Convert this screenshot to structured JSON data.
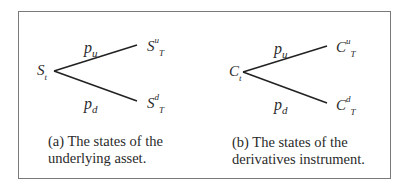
{
  "panels": [
    {
      "id": "a",
      "root": {
        "base": "S",
        "sub": "t"
      },
      "up_prob": {
        "base": "p",
        "sub": "u"
      },
      "down_prob": {
        "base": "p",
        "sub": "d"
      },
      "up_node": {
        "base": "S",
        "sup": "u",
        "sub": "T"
      },
      "down_node": {
        "base": "S",
        "sup": "d",
        "sub": "T"
      },
      "caption": [
        "(a) The states of the",
        "underlying asset."
      ]
    },
    {
      "id": "b",
      "root": {
        "base": "C",
        "sub": "t"
      },
      "up_prob": {
        "base": "p",
        "sub": "u"
      },
      "down_prob": {
        "base": "p",
        "sub": "d"
      },
      "up_node": {
        "base": "C",
        "sup": "u",
        "sub": "T"
      },
      "down_node": {
        "base": "C",
        "sup": "d",
        "sub": "T"
      },
      "caption": [
        "(b) The states of the",
        "derivatives instrument."
      ]
    }
  ]
}
